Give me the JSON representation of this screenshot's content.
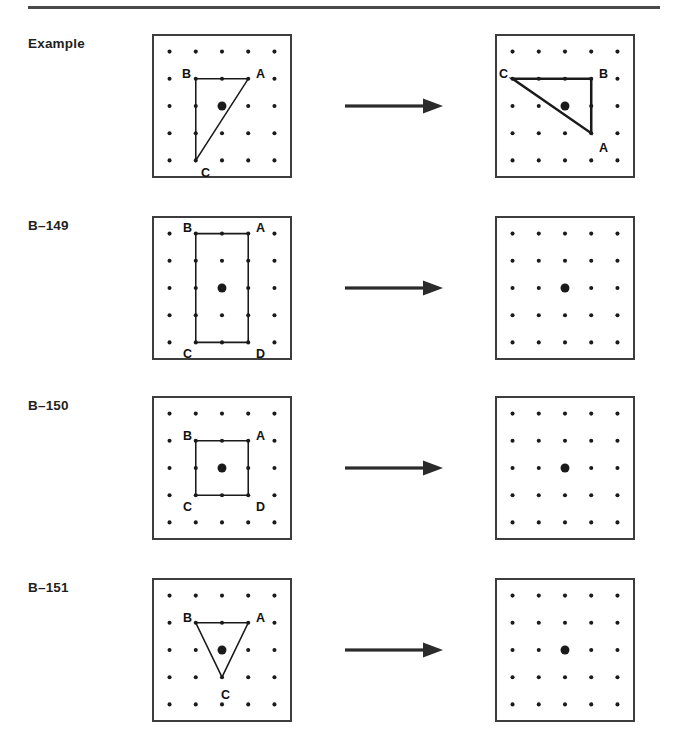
{
  "page": {
    "width": 684,
    "height": 738,
    "background": "#ffffff",
    "ink_color": "#1a1a1a",
    "rule_color": "#4a4a4a",
    "box_border_color": "#3d3d3d",
    "dot_color": "#1a1a1a"
  },
  "grid": {
    "columns": 5,
    "rows": 5,
    "dot_radius": 2.1,
    "center_dot_radius": 4.6,
    "center_dot_col": 3,
    "center_dot_row": 3
  },
  "arrow": {
    "name": "transformation-arrow",
    "label": "maps to",
    "color": "#2b2b2b",
    "shaft_length": 78,
    "head_length": 20
  },
  "rows": [
    {
      "id": "example",
      "label": "Example",
      "top": 34,
      "box": {
        "top": 34,
        "width": 140,
        "height": 144
      },
      "arrow_top": 95,
      "left_figure": {
        "name": "example-source-shape",
        "type": "triangle",
        "vertices": [
          {
            "label": "A",
            "col": 4,
            "row": 2,
            "label_dx": 5,
            "label_dy": -12
          },
          {
            "label": "B",
            "col": 2,
            "row": 2,
            "label_dx": -15,
            "label_dy": -12
          },
          {
            "label": "C",
            "col": 2,
            "row": 5,
            "label_dx": 4,
            "label_dy": 3
          }
        ],
        "stroke_width": 1.6
      },
      "right_figure": {
        "name": "example-result-shape",
        "type": "triangle",
        "vertices": [
          {
            "label": "C",
            "col": 1,
            "row": 2,
            "label_dx": -14,
            "label_dy": -12
          },
          {
            "label": "B",
            "col": 4,
            "row": 2,
            "label_dx": 5,
            "label_dy": -12
          },
          {
            "label": "A",
            "col": 4,
            "row": 4,
            "label_dx": 5,
            "label_dy": 6
          }
        ],
        "stroke_width": 2.6
      }
    },
    {
      "id": "b-149",
      "label": "B–149",
      "top": 216,
      "box": {
        "top": 216,
        "width": 140,
        "height": 144
      },
      "arrow_top": 277,
      "left_figure": {
        "name": "b149-source-shape",
        "type": "rectangle",
        "vertices": [
          {
            "label": "B",
            "col": 2,
            "row": 1,
            "label_dx": -14,
            "label_dy": -12
          },
          {
            "label": "A",
            "col": 4,
            "row": 1,
            "label_dx": 5,
            "label_dy": -12
          },
          {
            "label": "D",
            "col": 4,
            "row": 5,
            "label_dx": 5,
            "label_dy": 2
          },
          {
            "label": "C",
            "col": 2,
            "row": 5,
            "label_dx": -14,
            "label_dy": 2
          }
        ],
        "stroke_width": 1.6
      },
      "right_figure": {
        "name": "b149-answer-grid",
        "type": "empty"
      }
    },
    {
      "id": "b-150",
      "label": "B–150",
      "top": 396,
      "box": {
        "top": 396,
        "width": 140,
        "height": 144
      },
      "arrow_top": 457,
      "left_figure": {
        "name": "b150-source-shape",
        "type": "square",
        "vertices": [
          {
            "label": "B",
            "col": 2,
            "row": 2,
            "label_dx": -14,
            "label_dy": -12
          },
          {
            "label": "A",
            "col": 4,
            "row": 2,
            "label_dx": 5,
            "label_dy": -12
          },
          {
            "label": "D",
            "col": 4,
            "row": 4,
            "label_dx": 5,
            "label_dy": 3
          },
          {
            "label": "C",
            "col": 2,
            "row": 4,
            "label_dx": -14,
            "label_dy": 3
          }
        ],
        "stroke_width": 1.6
      },
      "right_figure": {
        "name": "b150-answer-grid",
        "type": "empty"
      }
    },
    {
      "id": "b-151",
      "label": "B–151",
      "top": 578,
      "box": {
        "top": 578,
        "width": 140,
        "height": 144
      },
      "arrow_top": 639,
      "left_figure": {
        "name": "b151-source-shape",
        "type": "triangle",
        "vertices": [
          {
            "label": "B",
            "col": 2,
            "row": 2,
            "label_dx": -14,
            "label_dy": -12
          },
          {
            "label": "A",
            "col": 4,
            "row": 2,
            "label_dx": 5,
            "label_dy": -12
          },
          {
            "label": "C",
            "col": 3,
            "row": 4,
            "label_dx": -3,
            "label_dy": 9
          }
        ],
        "stroke_width": 1.6
      },
      "right_figure": {
        "name": "b151-answer-grid",
        "type": "empty"
      }
    }
  ]
}
